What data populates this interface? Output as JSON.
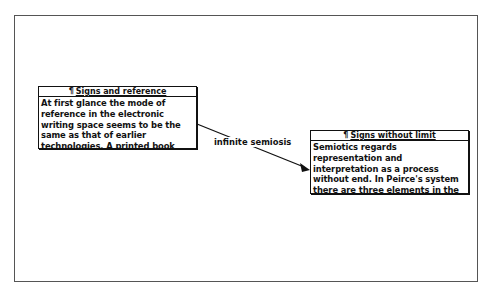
{
  "notes": [
    {
      "title": "Signs and reference",
      "title_icon": "pilcrow-icon",
      "body": "At first glance the mode of reference in the electronic writing space seems to be the same as that of earlier technologies.  A printed book consists of words on a page"
    },
    {
      "title": "Signs without limit",
      "title_icon": "pilcrow-icon",
      "body": "Semiotics regards representation and interpretation as a process without end. In Peirce's system there are three elements in the process: the sign, the thing"
    }
  ],
  "link": {
    "label": "infinite semiosis",
    "from": "Signs and reference",
    "to": "Signs without limit"
  },
  "glyphs": {
    "pilcrow": "¶"
  },
  "colors": {
    "ink": "#111111",
    "frame": "#555555",
    "background": "#ffffff"
  }
}
